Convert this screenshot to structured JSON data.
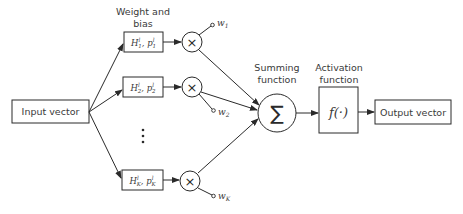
{
  "diagram": {
    "type": "neuron-model",
    "nodes": {
      "input": {
        "label": "Input vector"
      },
      "weight_header": {
        "line1": "Weight and",
        "line2": "bias"
      },
      "weights": [
        {
          "H": "H",
          "H_sub": "1",
          "H_sup": "l",
          "p": "p",
          "p_sub": "1",
          "p_sup": "l",
          "w": "w",
          "w_sub": "1"
        },
        {
          "H": "H",
          "H_sub": "2",
          "H_sup": "l",
          "p": "p",
          "p_sub": "2",
          "p_sup": "l",
          "w": "w",
          "w_sub": "2"
        },
        {
          "H": "H",
          "H_sub": "K",
          "H_sup": "l",
          "p": "p",
          "p_sub": "K",
          "p_sup": "l",
          "w": "w",
          "w_sub": "K"
        }
      ],
      "ellipsis": "⋮",
      "multiply_symbol": "×",
      "summing": {
        "line1": "Summing",
        "line2": "function",
        "symbol": "∑"
      },
      "activation": {
        "line1": "Activation",
        "line2": "function",
        "symbol": "f(·)"
      },
      "output": {
        "label": "Output vector"
      }
    },
    "edges": [
      [
        "input",
        "weight_1"
      ],
      [
        "input",
        "weight_2"
      ],
      [
        "input",
        "weight_K"
      ],
      [
        "weight_1",
        "multiply_1"
      ],
      [
        "weight_2",
        "multiply_2"
      ],
      [
        "weight_K",
        "multiply_K"
      ],
      [
        "multiply_1",
        "summing"
      ],
      [
        "multiply_2",
        "summing"
      ],
      [
        "multiply_K",
        "summing"
      ],
      [
        "summing",
        "activation"
      ],
      [
        "activation",
        "output"
      ]
    ],
    "colors": {
      "stroke": "#2a2a2a",
      "text": "#3a3a3a",
      "background": "#ffffff"
    }
  }
}
